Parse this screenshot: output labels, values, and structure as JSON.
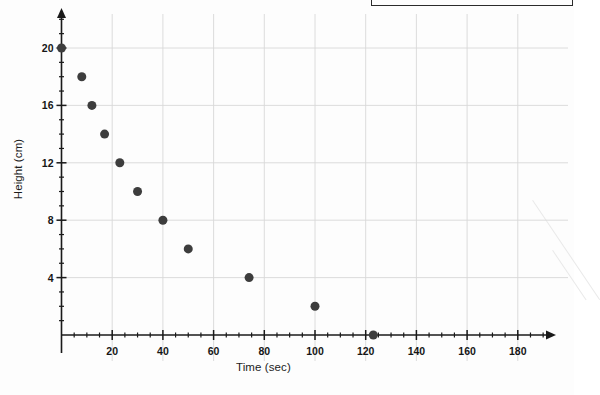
{
  "chart_data": {
    "type": "scatter",
    "title": "",
    "xlabel": "Time (sec)",
    "ylabel": "Height (cm)",
    "xlim": [
      0,
      190
    ],
    "ylim": [
      0,
      22
    ],
    "xticks": [
      20,
      40,
      60,
      80,
      100,
      120,
      140,
      160,
      180
    ],
    "yticks": [
      4,
      8,
      12,
      16,
      20
    ],
    "xtick_labels": [
      "20",
      "40",
      "60",
      "80",
      "100",
      "120",
      "140",
      "160",
      "180"
    ],
    "ytick_labels": [
      "4",
      "8",
      "12",
      "16",
      "20"
    ],
    "x_minor_tick_step": 5,
    "y_minor_tick_step": 1,
    "grid": true,
    "grid_color": "#d8d8d8",
    "axis_color": "#1a1a1a",
    "marker_color": "#3d3d3d",
    "marker_size": 9,
    "legend": null,
    "annotations": [],
    "points": [
      {
        "x": 0,
        "y": 20
      },
      {
        "x": 8,
        "y": 18
      },
      {
        "x": 12,
        "y": 16
      },
      {
        "x": 17,
        "y": 14
      },
      {
        "x": 23,
        "y": 12
      },
      {
        "x": 30,
        "y": 10
      },
      {
        "x": 40,
        "y": 8
      },
      {
        "x": 50,
        "y": 6
      },
      {
        "x": 74,
        "y": 4
      },
      {
        "x": 100,
        "y": 2
      },
      {
        "x": 123,
        "y": 0
      }
    ],
    "series": [
      {
        "name": "Height vs Time",
        "x": [
          0,
          8,
          12,
          17,
          23,
          30,
          40,
          50,
          74,
          100,
          123
        ],
        "values": [
          20,
          18,
          16,
          14,
          12,
          10,
          8,
          6,
          4,
          2,
          0
        ]
      }
    ]
  },
  "figure": {
    "background_color": "#fdfdfd",
    "has_scan_artifacts": true
  }
}
